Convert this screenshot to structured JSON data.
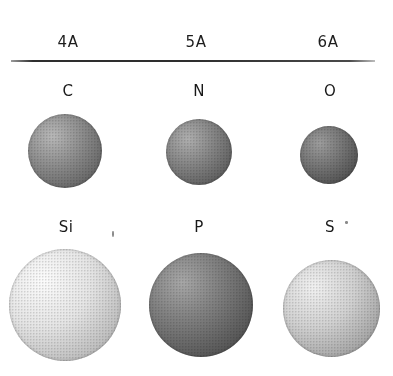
{
  "figure": {
    "background_color": "#ffffff",
    "rule_color": "#2e2e2e"
  },
  "columns": [
    {
      "id": "group-4a",
      "label": "4A",
      "center_x": 68
    },
    {
      "id": "group-5a",
      "label": "5A",
      "center_x": 196
    },
    {
      "id": "group-6a",
      "label": "6A",
      "center_x": 328
    }
  ],
  "rows": [
    {
      "id": "period-2",
      "elements": [
        {
          "symbol": "C",
          "group": "4A",
          "label_x": 68,
          "label_y": 82,
          "sphere": {
            "cx": 65,
            "cy": 151,
            "d": 74,
            "base": "#8d8d8d",
            "light": "#b9b9b9",
            "dark": "#5e5e5e",
            "hl_x": 33,
            "hl_y": 30
          }
        },
        {
          "symbol": "N",
          "group": "5A",
          "label_x": 199,
          "label_y": 82,
          "sphere": {
            "cx": 199,
            "cy": 152,
            "d": 66,
            "base": "#858585",
            "light": "#b0b0b0",
            "dark": "#565656",
            "hl_x": 33,
            "hl_y": 30
          }
        },
        {
          "symbol": "O",
          "group": "6A",
          "label_x": 330,
          "label_y": 82,
          "sphere": {
            "cx": 329,
            "cy": 155,
            "d": 58,
            "base": "#757575",
            "light": "#9e9e9e",
            "dark": "#4a4a4a",
            "hl_x": 34,
            "hl_y": 30
          }
        }
      ]
    },
    {
      "id": "period-3",
      "elements": [
        {
          "symbol": "Si",
          "group": "4A",
          "label_x": 66,
          "label_y": 218,
          "sphere": {
            "cx": 65,
            "cy": 305,
            "d": 112,
            "base": "#e6e6e6",
            "light": "#fdfdfd",
            "dark": "#b4b4b4",
            "hl_x": 31,
            "hl_y": 28
          }
        },
        {
          "symbol": "P",
          "group": "5A",
          "label_x": 199,
          "label_y": 218,
          "sphere": {
            "cx": 201,
            "cy": 305,
            "d": 104,
            "base": "#7b7b7b",
            "light": "#a8a8a8",
            "dark": "#4c4c4c",
            "hl_x": 32,
            "hl_y": 28
          }
        },
        {
          "symbol": "S",
          "group": "6A",
          "label_x": 330,
          "label_y": 218,
          "sphere": {
            "cx": 331,
            "cy": 308,
            "d": 97,
            "base": "#d2d2d2",
            "light": "#f2f2f2",
            "dark": "#9a9a9a",
            "hl_x": 32,
            "hl_y": 28
          }
        }
      ]
    }
  ],
  "artifacts": [
    {
      "x": 112,
      "y": 231,
      "w": 2,
      "h": 6
    },
    {
      "x": 345,
      "y": 221,
      "w": 3,
      "h": 3
    }
  ]
}
